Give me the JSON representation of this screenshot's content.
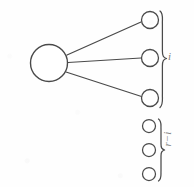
{
  "figure": {
    "stroke_color": "#4a4a4a",
    "fill_color": "#ffffff",
    "background_color": "#fefefe",
    "canvas": {
      "width": 194,
      "height": 187
    }
  },
  "source_node": {
    "name": "source-node",
    "cx": 49,
    "cy": 63,
    "r": 19
  },
  "connected_group": {
    "label": "i",
    "node_count": 3,
    "nodes": [
      {
        "cx": 150,
        "cy": 20,
        "r": 9
      },
      {
        "cx": 150,
        "cy": 58,
        "r": 9
      },
      {
        "cx": 150,
        "cy": 99,
        "r": 9
      }
    ],
    "brace": {
      "x": 161,
      "y_top": 11,
      "y_bottom": 108,
      "y_mid": 59,
      "width": 8
    }
  },
  "isolated_group": {
    "label": "r−i",
    "node_count": 3,
    "nodes": [
      {
        "cx": 150,
        "cy": 126,
        "r": 7
      },
      {
        "cx": 150,
        "cy": 150,
        "r": 7
      },
      {
        "cx": 150,
        "cy": 174,
        "r": 7
      }
    ],
    "brace": {
      "x": 161,
      "y_top": 119,
      "y_bottom": 181,
      "y_mid": 150,
      "width": 8
    }
  },
  "edges": [
    {
      "name": "edge-to-node-1",
      "x1": 67,
      "y1": 55,
      "x2": 141,
      "y2": 22
    },
    {
      "name": "edge-to-node-2",
      "x1": 68,
      "y1": 62,
      "x2": 141,
      "y2": 58
    },
    {
      "name": "edge-to-node-3",
      "x1": 66,
      "y1": 72,
      "x2": 141,
      "y2": 97
    }
  ]
}
